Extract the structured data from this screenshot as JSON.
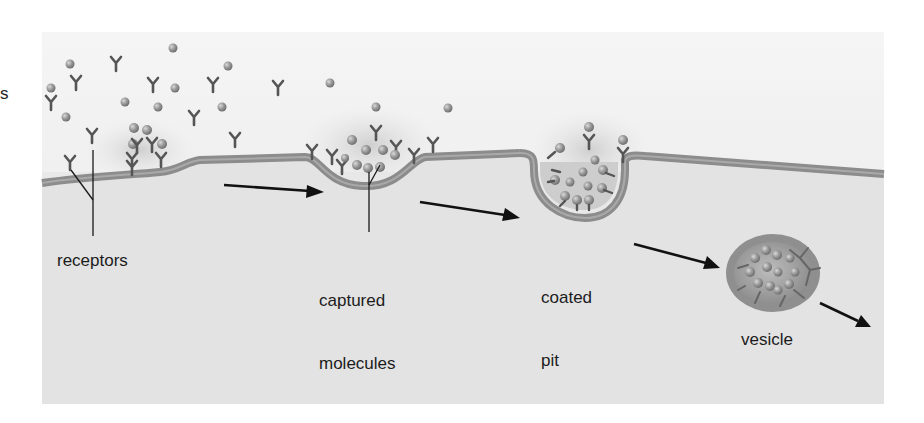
{
  "figure": {
    "cut_label_fragment": "s",
    "labels": {
      "receptors": "receptors",
      "captured_line1": "captured",
      "captured_line2": "molecules",
      "coated_line1": "coated",
      "coated_line2": "pit",
      "vesicle": "vesicle"
    },
    "stages": [
      "receptors",
      "captured molecules",
      "coated pit",
      "vesicle"
    ],
    "colors": {
      "background_panel": "#e4e4e4",
      "extracellular": "#f2f2f2",
      "membrane": "#8c8c8c",
      "membrane_highlight": "#a8a8a8",
      "arrow": "#111111",
      "label_text": "#1c1c1c"
    }
  }
}
